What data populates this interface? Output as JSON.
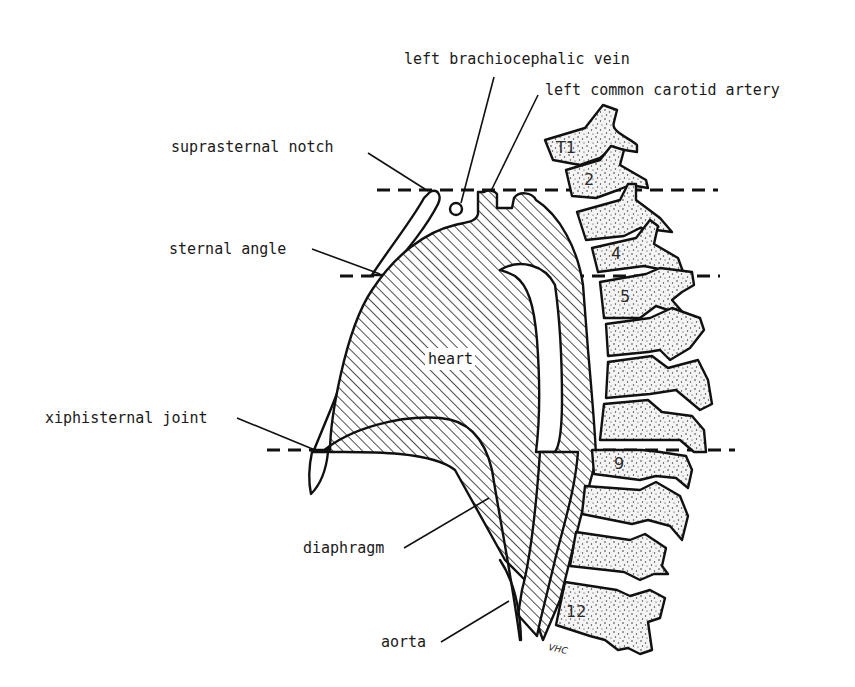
{
  "diagram": {
    "labels": {
      "left_brachiocephalic_vein": "left brachiocephalic vein",
      "left_common_carotid_artery": "left common carotid artery",
      "suprasternal_notch": "suprasternal notch",
      "sternal_angle": "sternal angle",
      "heart": "heart",
      "xiphisternal_joint": "xiphisternal joint",
      "diaphragm": "diaphragm",
      "aorta": "aorta"
    },
    "vertebrae": {
      "t1": "T1",
      "t2": "2",
      "t4": "4",
      "t5": "5",
      "t9": "9",
      "t12": "12"
    },
    "levels": [
      {
        "name": "suprasternal notch",
        "vertebral_level": "T2-T3"
      },
      {
        "name": "sternal angle",
        "vertebral_level": "T4-T5"
      },
      {
        "name": "xiphisternal joint",
        "vertebral_level": "T9"
      }
    ],
    "signature": "VHC",
    "colors": {
      "ink": "#111111",
      "background": "#ffffff"
    }
  }
}
